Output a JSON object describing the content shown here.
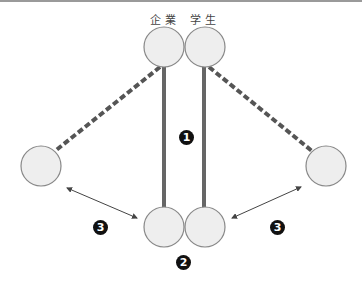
{
  "labels": {
    "company": "企業",
    "student": "学生"
  },
  "markers": {
    "one": "1",
    "two": "2",
    "three_left": "3",
    "three_right": "3"
  },
  "colors": {
    "circle_fill": "#eeeeee",
    "circle_stroke": "#888888",
    "bar": "#666666",
    "dash": "#555555",
    "arrow": "#444444",
    "marker_bg": "#111111"
  },
  "nodes": [
    {
      "id": "company-top",
      "cx": 164,
      "cy": 47
    },
    {
      "id": "student-top",
      "cx": 205,
      "cy": 47
    },
    {
      "id": "left",
      "cx": 41,
      "cy": 166
    },
    {
      "id": "right",
      "cx": 326,
      "cy": 166
    },
    {
      "id": "company-bottom",
      "cx": 164,
      "cy": 227
    },
    {
      "id": "student-bottom",
      "cx": 205,
      "cy": 227
    }
  ]
}
